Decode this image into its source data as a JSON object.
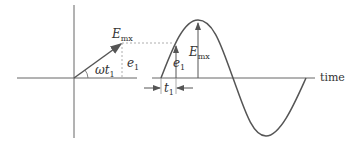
{
  "diagram": {
    "labels": {
      "emx_phasor": {
        "main": "E",
        "sub": "mx"
      },
      "e1_phasor": {
        "main": "e",
        "sub": "1"
      },
      "omega_t1": {
        "main": "ωt",
        "sub": "1"
      },
      "emx_wave": {
        "main": "E",
        "sub": "mx"
      },
      "e1_wave": {
        "main": "e",
        "sub": "1"
      },
      "t1": {
        "main": "t",
        "sub": "1"
      },
      "time": "time"
    },
    "colors": {
      "stroke": "#555555",
      "dashed": "#888888",
      "text": "#333333"
    }
  }
}
